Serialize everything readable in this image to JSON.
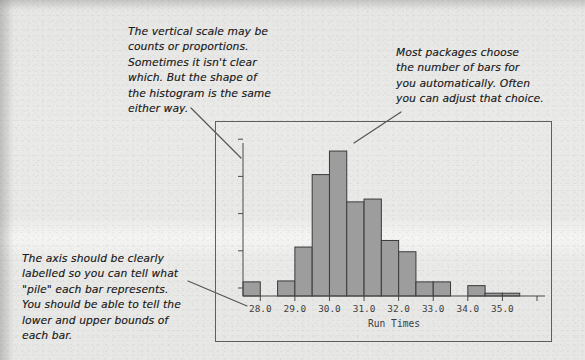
{
  "annotations": [
    {
      "id": "vertical-scale",
      "text": "The vertical scale may be\ncounts or proportions.\nSometimes it isn't clear\nwhich. But the shape of\nthe histogram is the same\neither way."
    },
    {
      "id": "bar-count",
      "text": "Most packages choose\nthe number of bars for\nyou automatically. Often\nyou can adjust that choice."
    },
    {
      "id": "axis-label",
      "text": "The axis should be clearly\nlabelled so you can tell what\n\"pile\" each bar represents.\nYou should be able to tell the\nlower and upper bounds of\neach bar."
    }
  ],
  "colors": {
    "bar_fill": "#9d9d9d",
    "bar_stroke": "#3a3a3a",
    "axis": "#4a4a4a",
    "frame": "#5e5e5e",
    "ink": "#1d1d1d",
    "paper": "#e9e9e7"
  },
  "chart_data": {
    "type": "bar",
    "title": "",
    "xlabel": "Run Times",
    "ylabel": "",
    "grid": false,
    "legend": "none",
    "y_axis_labeled": false,
    "y_tick_count": 5,
    "ylim": [
      0,
      170
    ],
    "xlim": [
      27.5,
      36.0
    ],
    "x_tick_labels": [
      "28.0",
      "29.0",
      "30.0",
      "31.0",
      "32.0",
      "33.0",
      "34.0",
      "35.0"
    ],
    "x_tick_values": [
      28.0,
      29.0,
      30.0,
      31.0,
      32.0,
      33.0,
      34.0,
      35.0
    ],
    "bin_width": 0.5,
    "bins": [
      {
        "start": 27.5,
        "end": 28.0,
        "value": 15
      },
      {
        "start": 28.0,
        "end": 28.5,
        "value": 0
      },
      {
        "start": 28.5,
        "end": 29.0,
        "value": 16
      },
      {
        "start": 29.0,
        "end": 29.5,
        "value": 52
      },
      {
        "start": 29.5,
        "end": 30.0,
        "value": 129
      },
      {
        "start": 30.0,
        "end": 30.5,
        "value": 154
      },
      {
        "start": 30.5,
        "end": 31.0,
        "value": 100
      },
      {
        "start": 31.0,
        "end": 31.5,
        "value": 103
      },
      {
        "start": 31.5,
        "end": 32.0,
        "value": 59
      },
      {
        "start": 32.0,
        "end": 32.5,
        "value": 47
      },
      {
        "start": 32.5,
        "end": 33.0,
        "value": 15
      },
      {
        "start": 33.0,
        "end": 33.5,
        "value": 15
      },
      {
        "start": 33.5,
        "end": 34.0,
        "value": 0
      },
      {
        "start": 34.0,
        "end": 34.5,
        "value": 11
      },
      {
        "start": 34.5,
        "end": 35.0,
        "value": 3
      },
      {
        "start": 35.0,
        "end": 35.5,
        "value": 3
      }
    ],
    "categories": [
      "27.5-28.0",
      "28.0-28.5",
      "28.5-29.0",
      "29.0-29.5",
      "29.5-30.0",
      "30.0-30.5",
      "30.5-31.0",
      "31.0-31.5",
      "31.5-32.0",
      "32.0-32.5",
      "32.5-33.0",
      "33.0-33.5",
      "33.5-34.0",
      "34.0-34.5",
      "34.5-35.0",
      "35.0-35.5"
    ],
    "values": [
      15,
      0,
      16,
      52,
      129,
      154,
      100,
      103,
      59,
      47,
      15,
      15,
      0,
      11,
      3,
      3
    ]
  }
}
